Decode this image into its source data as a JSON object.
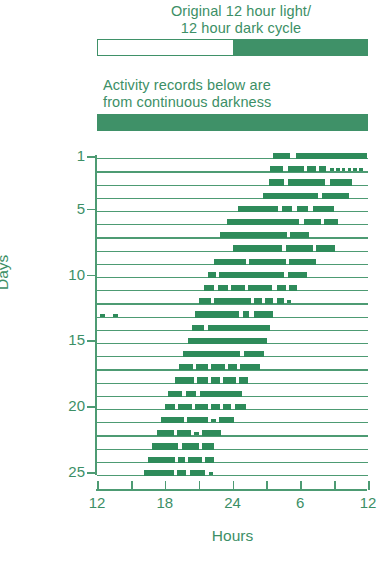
{
  "figure": {
    "captions": {
      "light_dark": "Original 12 hour light/\n12 hour dark cycle",
      "continuous": "Activity records below are\nfrom continuous darkness"
    },
    "colors": {
      "green": "#3f9168",
      "bar_dark": "#2e8b5a",
      "line": "#4d9b73",
      "background": "#ffffff"
    },
    "schedule_bars": [
      {
        "name": "original-light-dark-cycle",
        "segments": [
          {
            "label": "light",
            "fill": "light",
            "fraction": 0.5
          },
          {
            "label": "dark",
            "fill": "dark",
            "fraction": 0.5
          }
        ]
      },
      {
        "name": "constant-darkness",
        "segments": [
          {
            "label": "dark",
            "fill": "dark",
            "fraction": 1.0
          }
        ]
      }
    ]
  },
  "chart_data": {
    "type": "actogram",
    "subtitle": "Activity records below are from continuous darkness",
    "xlabel": "Hours",
    "ylabel": "Days",
    "xlim": [
      12,
      36
    ],
    "ylim": [
      1,
      25
    ],
    "grid": false,
    "legend": null,
    "x_ticks": [
      12,
      15,
      18,
      21,
      24,
      27,
      30,
      33,
      36
    ],
    "x_tick_labels": [
      "12",
      "",
      "18",
      "",
      "24",
      "",
      "6",
      "",
      "12"
    ],
    "y_ticks": [
      1,
      5,
      10,
      15,
      20,
      25
    ],
    "y_tick_labels": [
      "1",
      "5",
      "10",
      "15",
      "20",
      "25"
    ],
    "note": "Free-running circadian activity rhythm in constant darkness; activity onset drifts later each day (period slightly > 24 h).",
    "days": [
      {
        "day": 1,
        "bouts": [
          [
            27.6,
            29.1
          ],
          [
            29.6,
            35.9
          ]
        ]
      },
      {
        "day": 2,
        "bouts": [
          [
            27.3,
            28.5
          ],
          [
            28.9,
            30.3
          ],
          [
            30.6,
            31.4
          ],
          [
            31.7,
            32.3
          ],
          [
            32.6,
            33.0
          ],
          [
            33.2,
            33.5
          ],
          [
            33.7,
            34.0
          ],
          [
            34.2,
            34.5
          ],
          [
            34.7,
            35.0
          ],
          [
            35.2,
            35.6
          ]
        ]
      },
      {
        "day": 3,
        "bouts": [
          [
            27.2,
            28.6
          ],
          [
            28.9,
            32.2
          ],
          [
            32.6,
            34.6
          ]
        ]
      },
      {
        "day": 4,
        "bouts": [
          [
            26.7,
            31.6
          ],
          [
            31.9,
            34.3
          ]
        ]
      },
      {
        "day": 5,
        "bouts": [
          [
            24.5,
            28.0
          ],
          [
            28.4,
            29.3
          ],
          [
            29.7,
            30.7
          ],
          [
            31.1,
            33.0
          ]
        ]
      },
      {
        "day": 6,
        "bouts": [
          [
            23.5,
            29.9
          ],
          [
            30.3,
            31.8
          ],
          [
            32.1,
            33.3
          ]
        ]
      },
      {
        "day": 7,
        "bouts": [
          [
            22.9,
            28.8
          ],
          [
            29.1,
            30.8
          ]
        ]
      },
      {
        "day": 8,
        "bouts": [
          [
            24.0,
            28.4
          ],
          [
            28.7,
            31.1
          ],
          [
            31.4,
            33.1
          ]
        ]
      },
      {
        "day": 9,
        "bouts": [
          [
            22.4,
            25.2
          ],
          [
            25.5,
            28.7
          ],
          [
            29.0,
            31.4
          ]
        ]
      },
      {
        "day": 10,
        "bouts": [
          [
            21.8,
            22.5
          ],
          [
            22.8,
            28.6
          ],
          [
            28.9,
            30.6
          ]
        ]
      },
      {
        "day": 11,
        "bouts": [
          [
            21.5,
            22.4
          ],
          [
            22.7,
            23.6
          ],
          [
            23.9,
            25.1
          ],
          [
            25.4,
            27.5
          ],
          [
            27.9,
            28.7
          ],
          [
            29.0,
            29.7
          ]
        ]
      },
      {
        "day": 12,
        "bouts": [
          [
            21.0,
            22.1
          ],
          [
            22.4,
            25.6
          ],
          [
            25.9,
            26.6
          ],
          [
            26.9,
            27.6
          ],
          [
            27.9,
            28.6
          ],
          [
            28.8,
            29.2
          ]
        ]
      },
      {
        "day": 13,
        "bouts": [
          [
            12.3,
            12.7
          ],
          [
            13.4,
            13.9
          ],
          [
            20.7,
            24.6
          ],
          [
            24.9,
            25.5
          ],
          [
            25.9,
            27.6
          ]
        ]
      },
      {
        "day": 14,
        "bouts": [
          [
            20.4,
            21.5
          ],
          [
            21.8,
            27.3
          ]
        ]
      },
      {
        "day": 15,
        "bouts": [
          [
            20.1,
            27.1
          ]
        ]
      },
      {
        "day": 16,
        "bouts": [
          [
            19.6,
            24.7
          ],
          [
            25.0,
            26.8
          ]
        ]
      },
      {
        "day": 17,
        "bouts": [
          [
            19.3,
            20.5
          ],
          [
            20.8,
            21.8
          ],
          [
            22.1,
            23.3
          ],
          [
            23.6,
            24.4
          ],
          [
            24.7,
            26.4
          ]
        ]
      },
      {
        "day": 18,
        "bouts": [
          [
            18.9,
            20.6
          ],
          [
            20.9,
            21.8
          ],
          [
            22.1,
            22.9
          ],
          [
            23.2,
            24.3
          ],
          [
            24.6,
            25.4
          ]
        ]
      },
      {
        "day": 19,
        "bouts": [
          [
            18.3,
            19.5
          ],
          [
            19.9,
            20.8
          ],
          [
            21.1,
            24.8
          ]
        ]
      },
      {
        "day": 20,
        "bouts": [
          [
            18.0,
            18.9
          ],
          [
            19.2,
            20.4
          ],
          [
            20.7,
            21.8
          ],
          [
            22.1,
            22.9
          ],
          [
            23.2,
            23.9
          ],
          [
            24.2,
            25.2
          ]
        ]
      },
      {
        "day": 21,
        "bouts": [
          [
            17.7,
            19.7
          ],
          [
            20.0,
            21.8
          ],
          [
            22.1,
            22.5
          ],
          [
            22.8,
            24.1
          ]
        ]
      },
      {
        "day": 22,
        "bouts": [
          [
            17.3,
            18.8
          ],
          [
            19.1,
            20.3
          ],
          [
            20.6,
            21.0
          ],
          [
            21.3,
            23.0
          ]
        ]
      },
      {
        "day": 23,
        "bouts": [
          [
            16.9,
            19.2
          ],
          [
            19.5,
            21.0
          ],
          [
            21.3,
            22.4
          ]
        ]
      },
      {
        "day": 24,
        "bouts": [
          [
            16.5,
            18.9
          ],
          [
            19.2,
            19.8
          ],
          [
            20.1,
            21.3
          ],
          [
            21.6,
            22.4
          ]
        ]
      },
      {
        "day": 25,
        "bouts": [
          [
            16.2,
            18.8
          ],
          [
            19.1,
            19.9
          ],
          [
            20.2,
            21.6
          ],
          [
            21.9,
            22.3
          ]
        ]
      }
    ]
  }
}
